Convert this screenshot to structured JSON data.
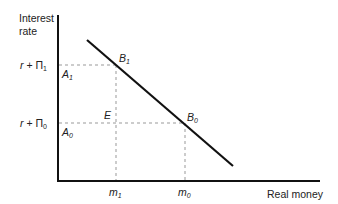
{
  "diagram": {
    "y_axis_label_line1": "Interest",
    "y_axis_label_line2": "rate",
    "x_axis_label": "Real money",
    "y_ticks": [
      {
        "r": "r",
        "plus": " + ",
        "pi": "Π",
        "sub": "1"
      },
      {
        "r": "r",
        "plus": " + ",
        "pi": "Π",
        "sub": "0"
      }
    ],
    "x_ticks": [
      {
        "m": "m",
        "sub": "1"
      },
      {
        "m": "m",
        "sub": "0"
      }
    ],
    "points": {
      "A1": {
        "letter": "A",
        "sub": "1"
      },
      "A0": {
        "letter": "A",
        "sub": "0"
      },
      "B1": {
        "letter": "B",
        "sub": "1"
      },
      "B0": {
        "letter": "B",
        "sub": "0"
      },
      "E": {
        "letter": "E"
      }
    }
  }
}
